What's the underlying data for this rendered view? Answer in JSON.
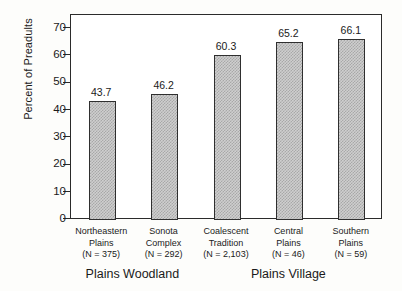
{
  "chart_data": {
    "type": "bar",
    "title": "",
    "subtitle": "",
    "xlabel": "",
    "ylabel": "Percent of Preadults",
    "ylim": [
      0,
      75
    ],
    "yticks": [
      0,
      10,
      20,
      30,
      40,
      50,
      60,
      70
    ],
    "ytick_labels": [
      "0",
      "10",
      "20",
      "30",
      "40",
      "50",
      "60",
      "70"
    ],
    "grid": false,
    "legend": null,
    "categories": [
      "Northeastern Plains",
      "Sonota Complex",
      "Coalescent Tradition",
      "Central Plains",
      "Southern Plains"
    ],
    "values": [
      43.7,
      46.2,
      60.3,
      65.2,
      66.1
    ],
    "value_labels": [
      "43.7",
      "46.2",
      "60.3",
      "65.2",
      "66.1"
    ],
    "sample_sizes": [
      "(N = 375)",
      "(N = 292)",
      "(N = 2,103)",
      "(N = 46)",
      "(N = 59)"
    ],
    "category_lines": [
      [
        "Northeastern",
        "Plains",
        "(N = 375)"
      ],
      [
        "Sonota",
        "Complex",
        "(N = 292)"
      ],
      [
        "Coalescent",
        "Tradition",
        "(N = 2,103)"
      ],
      [
        "Central",
        "Plains",
        "(N = 46)"
      ],
      [
        "Southern",
        "Plains",
        "(N = 59)"
      ]
    ],
    "groups": [
      {
        "label": "Plains Woodland",
        "members": [
          "Northeastern Plains",
          "Sonota Complex"
        ]
      },
      {
        "label": "Plains Village",
        "members": [
          "Coalescent Tradition",
          "Central Plains",
          "Southern Plains"
        ]
      }
    ],
    "colors": {
      "bar_fill": "#cfcfcf",
      "bar_hatch": "#a8a8a8",
      "bar_edge": "#2f2f2f",
      "axis": "#2b2b2b",
      "plot_background": "#ffffff",
      "page_background": "#fdfdfb",
      "text": "#1a1a1a"
    }
  }
}
